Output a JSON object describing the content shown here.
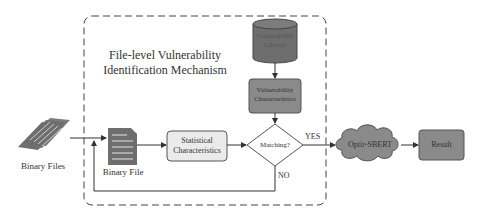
{
  "diagram": {
    "title_line1": "File-level Vulnerability",
    "title_line2": "Identification Mechanism",
    "nodes": {
      "binary_files": "Binary Files",
      "binary_file": "Binary File",
      "statistical_line1": "Statistical",
      "statistical_line2": "Characteristics",
      "library_line1": "Vulnerability",
      "library_line2": "Library",
      "vuln_char_line1": "Vulnerability",
      "vuln_char_line2": "Characteristics",
      "matching": "Matching?",
      "optir": "Optir-SBERT",
      "result": "Result"
    },
    "edges": {
      "yes": "YES",
      "no": "NO"
    },
    "colors": {
      "dark_fill": "#6e6e6e",
      "mid_fill": "#8a8a8a",
      "light_fill": "#ebebeb",
      "line": "#333333"
    }
  }
}
